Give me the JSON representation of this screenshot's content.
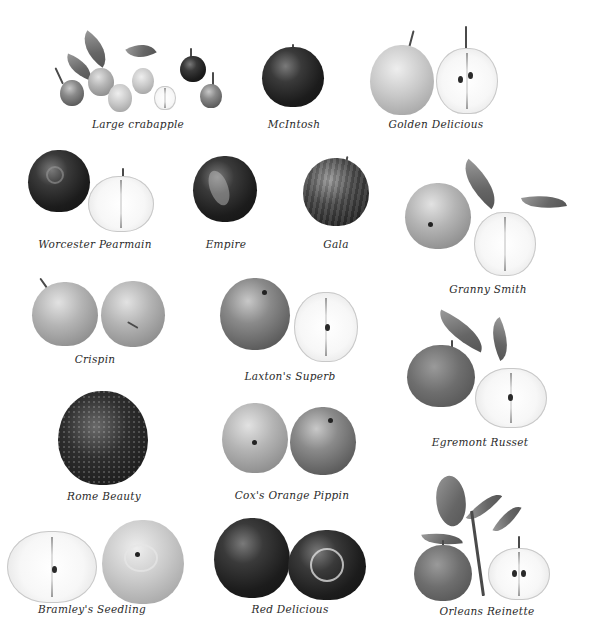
{
  "plate": {
    "subject": "Apple varieties",
    "varieties": [
      {
        "name": "Large crabapple",
        "row": 1,
        "column": 1
      },
      {
        "name": "McIntosh",
        "row": 1,
        "column": 2
      },
      {
        "name": "Golden Delicious",
        "row": 1,
        "column": 3
      },
      {
        "name": "Worcester Pearmain",
        "row": 2,
        "column": 1
      },
      {
        "name": "Empire",
        "row": 2,
        "column": 2
      },
      {
        "name": "Gala",
        "row": 2,
        "column": 3
      },
      {
        "name": "Granny Smith",
        "row": 2,
        "column": 4
      },
      {
        "name": "Crispin",
        "row": 3,
        "column": 1
      },
      {
        "name": "Laxton's Superb",
        "row": 3,
        "column": 2
      },
      {
        "name": "Egremont Russet",
        "row": 3,
        "column": 3
      },
      {
        "name": "Rome Beauty",
        "row": 4,
        "column": 1
      },
      {
        "name": "Cox's Orange Pippin",
        "row": 4,
        "column": 2
      },
      {
        "name": "Bramley's Seedling",
        "row": 5,
        "column": 1
      },
      {
        "name": "Red Delicious",
        "row": 5,
        "column": 2
      },
      {
        "name": "Orleans Reinette",
        "row": 5,
        "column": 3
      }
    ]
  },
  "captions": {
    "large_crabapple": "Large crabapple",
    "mcintosh": "McIntosh",
    "golden_delicious": "Golden Delicious",
    "worcester_pearmain": "Worcester Pearmain",
    "empire": "Empire",
    "gala": "Gala",
    "granny_smith": "Granny Smith",
    "crispin": "Crispin",
    "laxtons_superb": "Laxton's Superb",
    "egremont_russet": "Egremont Russet",
    "rome_beauty": "Rome Beauty",
    "coxs_orange_pippin": "Cox's Orange Pippin",
    "bramleys_seedling": "Bramley's Seedling",
    "red_delicious": "Red Delicious",
    "orleans_reinette": "Orleans Reinette"
  },
  "colors": {
    "background": "#ffffff",
    "caption_text": "#2a2a2a"
  }
}
